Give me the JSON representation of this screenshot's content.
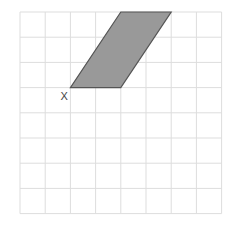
{
  "diagram": {
    "type": "grid-with-parallelogram",
    "grid": {
      "columns": 8,
      "rows": 8,
      "origin_px": [
        20,
        12
      ],
      "cell_px": 25.2,
      "line_color": "#dddddd",
      "background": "#ffffff"
    },
    "shape": {
      "name": "parallelogram",
      "vertices_grid": [
        [
          2,
          3
        ],
        [
          4,
          3
        ],
        [
          6,
          0
        ],
        [
          4,
          0
        ]
      ],
      "fill": "#999999",
      "stroke": "#555555"
    },
    "point_label": {
      "text": "X",
      "at_vertex_grid": [
        2,
        3
      ]
    }
  }
}
